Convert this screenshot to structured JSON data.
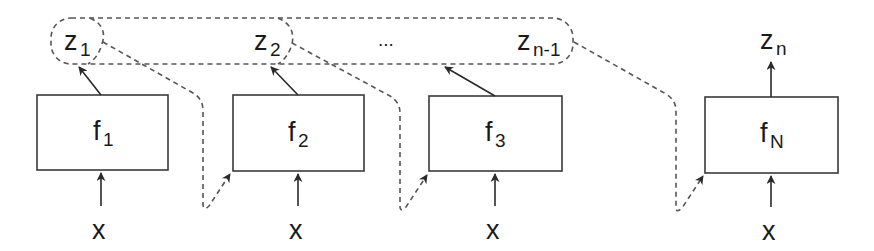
{
  "diagram": {
    "type": "sequential function chain with shared latent group",
    "colors": {
      "stroke": "#3a3a3a",
      "dashed": "#555555",
      "text": "#1a1a1a",
      "background": "#ffffff"
    },
    "latent_group": {
      "items": [
        {
          "base": "z",
          "sub": "1"
        },
        {
          "base": "z",
          "sub": "2"
        },
        {
          "ellipsis": "..."
        },
        {
          "base": "z",
          "sub": "n-1"
        }
      ]
    },
    "output": {
      "base": "z",
      "sub": "n"
    },
    "blocks": [
      {
        "base": "f",
        "sub": "1",
        "input": "x"
      },
      {
        "base": "f",
        "sub": "2",
        "input": "x"
      },
      {
        "base": "f",
        "sub": "3",
        "input": "x"
      },
      {
        "base": "f",
        "sub": "N",
        "input": "x"
      }
    ]
  }
}
